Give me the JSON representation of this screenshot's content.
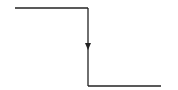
{
  "diagram": {
    "type": "step-connector",
    "stroke_color": "#222222",
    "background": "#ffffff",
    "segments": [
      {
        "name": "top-horizontal",
        "x1": 15,
        "y1": 8,
        "x2": 88,
        "y2": 8
      },
      {
        "name": "vertical-drop",
        "x1": 88,
        "y1": 8,
        "x2": 88,
        "y2": 86
      },
      {
        "name": "bottom-horizontal",
        "x1": 88,
        "y1": 86,
        "x2": 161,
        "y2": 86
      }
    ],
    "arrow": {
      "direction": "down",
      "x": 88,
      "y": 50
    }
  }
}
